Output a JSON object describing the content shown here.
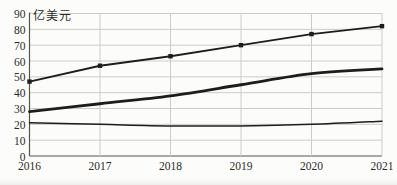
{
  "chart": {
    "colors": {
      "line": "#1d1d1b",
      "grid": "#ccccc6",
      "axis": "#55554f",
      "label": "#2b2b28",
      "background": "#fcfcfa"
    }
  },
  "chart_data": {
    "type": "line",
    "title": "",
    "unit": "亿美元",
    "xlabel": "",
    "ylabel": "亿美元",
    "categories": [
      "2016",
      "2017",
      "2018",
      "2019",
      "2020",
      "2021"
    ],
    "series": [
      {
        "name": "top-marker-series",
        "marker": "square",
        "smooth": false,
        "width": 1.8,
        "values": [
          47,
          57,
          63,
          70,
          77,
          82
        ]
      },
      {
        "name": "middle-bold-series",
        "marker": "none",
        "smooth": true,
        "width": 2.8,
        "values": [
          28,
          33,
          38,
          45,
          52,
          55
        ]
      },
      {
        "name": "bottom-thin-series",
        "marker": "none",
        "smooth": true,
        "width": 1.5,
        "values": [
          21,
          20,
          19,
          19,
          20,
          22
        ]
      }
    ],
    "ylim": [
      0,
      90
    ],
    "ytick_step": 10,
    "yticks": [
      "0",
      "10",
      "20",
      "30",
      "40",
      "50",
      "60",
      "70",
      "80",
      "90"
    ],
    "grid": true,
    "legend": false
  }
}
